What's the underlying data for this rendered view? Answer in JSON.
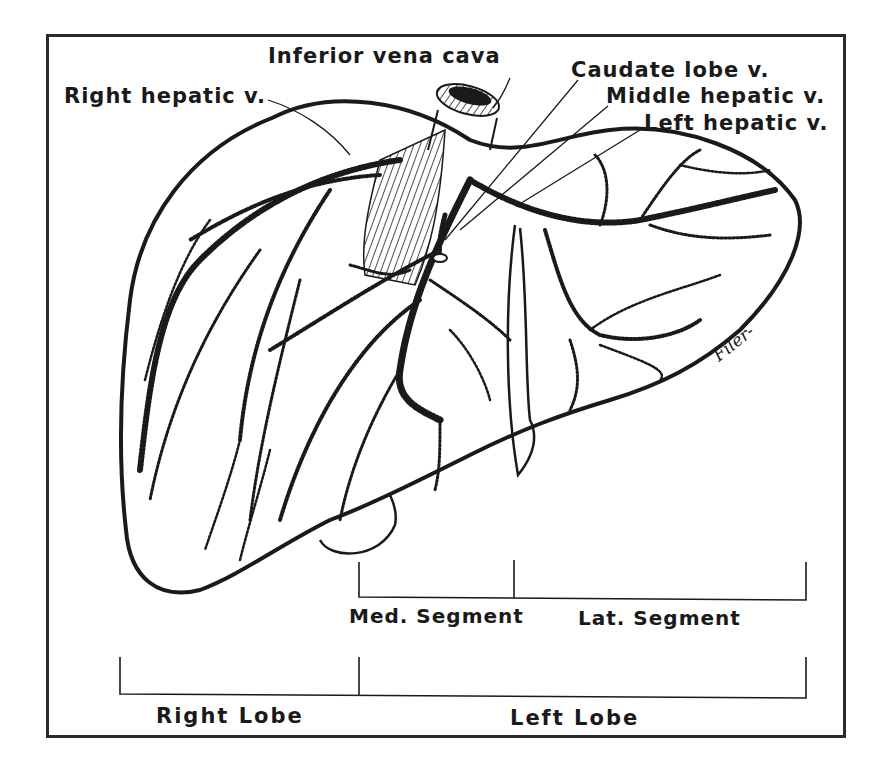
{
  "figure": {
    "labels": {
      "inferior_vena_cava": "Inferior vena cava",
      "right_hepatic_v": "Right hepatic v.",
      "caudate_lobe_v": "Caudate lobe v.",
      "middle_hepatic_v": "Middle hepatic v.",
      "left_hepatic_v": "Left hepatic v."
    },
    "segments": {
      "medial": "Med. Segment",
      "lateral": "Lat. Segment"
    },
    "lobes": {
      "right": "Right Lobe",
      "left": "Left Lobe"
    },
    "signature": "Filer-",
    "colors": {
      "ink": "#1a1a1a",
      "background": "#ffffff",
      "frame": "#2a2a2a"
    }
  }
}
